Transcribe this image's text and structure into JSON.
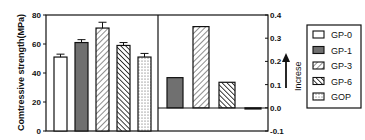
{
  "chart_data": [
    {
      "type": "bar",
      "title": "",
      "xlabel": "",
      "ylabel": "Comtressive strength(MPa)",
      "ylim": [
        0,
        80
      ],
      "yticks": [
        0,
        20,
        40,
        60,
        80
      ],
      "categories": [
        "GP-0",
        "GP-1",
        "GP-3",
        "GP-6",
        "GOP"
      ],
      "values": [
        51,
        61,
        71,
        59,
        51
      ],
      "errors": [
        2,
        2,
        4,
        2,
        2.5
      ],
      "grid": false
    },
    {
      "type": "bar",
      "title": "",
      "ylabel": "Increse",
      "ylim": [
        -0.1,
        0.4
      ],
      "yticks": [
        -0.1,
        0.0,
        0.1,
        0.2,
        0.3,
        0.4
      ],
      "categories": [
        "GP-1",
        "GP-3",
        "GP-6",
        "GOP"
      ],
      "values": [
        0.13,
        0.35,
        0.11,
        -0.005
      ],
      "grid": false
    }
  ],
  "axes": {
    "left_label": "Comtressive strength(MPa)",
    "left_ticks": [
      "0",
      "20",
      "40",
      "60",
      "80"
    ],
    "right_ticks": [
      "-0.1",
      "0.0",
      "0.1",
      "0.2",
      "0.3",
      "0.4"
    ],
    "increase_label": "Increse"
  },
  "legend": {
    "position": "right",
    "items": [
      {
        "label": "GP-0",
        "pattern": "white"
      },
      {
        "label": "GP-1",
        "pattern": "gray"
      },
      {
        "label": "GP-3",
        "pattern": "diag-right"
      },
      {
        "label": "GP-6",
        "pattern": "diag-left"
      },
      {
        "label": "GOP",
        "pattern": "dots"
      }
    ]
  },
  "colors": {
    "axis": "#111111",
    "gray_fill": "#707070",
    "background": "#ffffff"
  }
}
